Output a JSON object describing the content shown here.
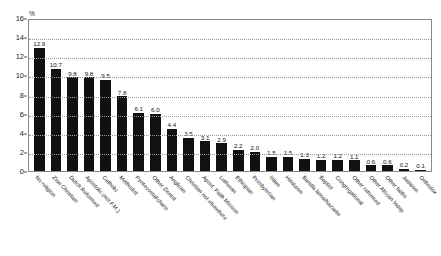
{
  "chart_data": {
    "type": "bar",
    "title": "",
    "subtitle": "",
    "xlabel": "",
    "ylabel": "%",
    "ylim": [
      0,
      16
    ],
    "yticks": [
      0,
      2,
      4,
      6,
      8,
      10,
      12,
      14,
      16
    ],
    "ytick_labels": [
      "0",
      "2",
      "4",
      "6",
      "8",
      "10",
      "12",
      "14",
      "16"
    ],
    "grid": true,
    "grid_orientation": "horizontal",
    "legend": false,
    "bar_color": "#111111",
    "categories": [
      "No religion",
      "Zion Christian",
      "Dutch Reformed",
      "Apostolic (not F.M.)",
      "Catholic",
      "Methodist",
      "Pentecostal/charis",
      "Other Zionist",
      "Anglican",
      "Christian not elsewhere",
      "Apost. Faith Mission",
      "Lutheran",
      "Ethiopian",
      "Presbyterian",
      "Islam",
      "Hinduism",
      "Bandla lama/Nazarite",
      "Baptist",
      "Congregational",
      "Other reformed",
      "Other African Indep",
      "Other faiths",
      "Judaism",
      "Orthodox"
    ],
    "values": [
      12.9,
      10.7,
      9.8,
      9.8,
      9.5,
      7.8,
      6.1,
      6.0,
      4.4,
      3.5,
      3.1,
      2.9,
      2.2,
      2.0,
      1.5,
      1.5,
      1.3,
      1.2,
      1.2,
      1.1,
      0.6,
      0.6,
      0.2,
      0.1
    ],
    "value_labels": [
      "12.9",
      "10.7",
      "9.8",
      "9.8",
      "9.5",
      "7.8",
      "6.1",
      "6.0",
      "4.4",
      "3.5",
      "3.1",
      "2.9",
      "2.2",
      "2.0",
      "1.5",
      "1.5",
      "1.3",
      "1.2",
      "1.2",
      "1.1",
      "0.6",
      "0.6",
      "0.2",
      "0.1"
    ]
  }
}
